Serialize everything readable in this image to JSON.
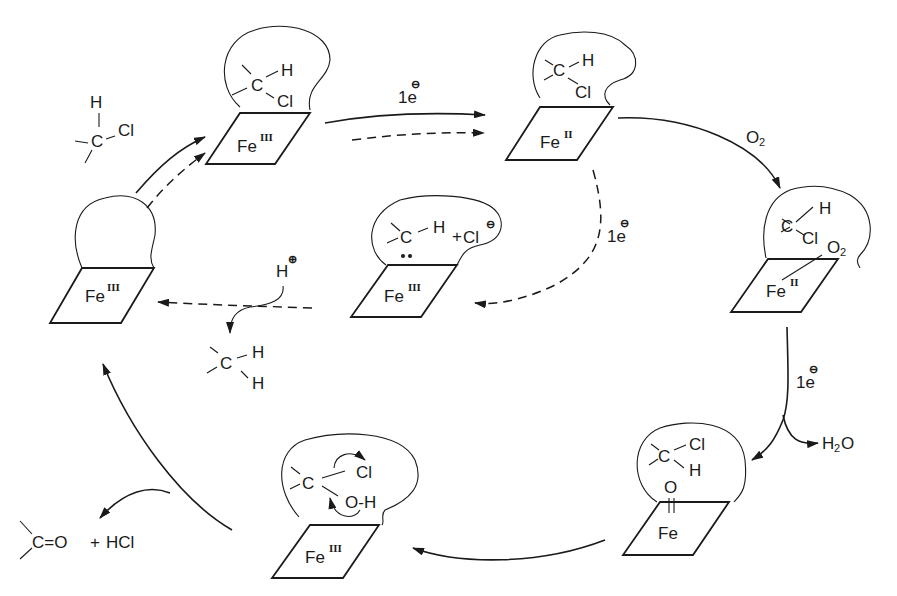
{
  "diagram": {
    "type": "catalytic-cycle",
    "iron_label": "Fe",
    "states": [
      {
        "id": "resting",
        "iron": "Fe",
        "oxidation": "III",
        "substrate": ""
      },
      {
        "id": "substrate-bound",
        "iron": "Fe",
        "oxidation": "III",
        "substrate": {
          "c": "C",
          "h": "H",
          "cl": "Cl"
        }
      },
      {
        "id": "reduced",
        "iron": "Fe",
        "oxidation": "II",
        "substrate": {
          "c": "C",
          "h": "H",
          "cl": "Cl"
        }
      },
      {
        "id": "oxy",
        "iron": "Fe",
        "oxidation": "II",
        "substrate": {
          "c": "C",
          "h": "H",
          "cl": "Cl",
          "o2": "O",
          "o2_sub": "2"
        }
      },
      {
        "id": "oxo",
        "iron": "Fe",
        "oxidation": "",
        "substrate": {
          "c": "C",
          "h": "H",
          "cl": "Cl",
          "o": "O"
        }
      },
      {
        "id": "hydroxylated",
        "iron": "Fe",
        "oxidation": "III",
        "substrate": {
          "c": "C",
          "cl": "Cl",
          "oh": "O-H"
        }
      },
      {
        "id": "carbene",
        "iron": "Fe",
        "oxidation": "III",
        "substrate": {
          "c": "C",
          "h": "H",
          "plus": "+",
          "cl": "Cl",
          "charge": "⊖"
        }
      }
    ],
    "free_substrate": {
      "h": "H",
      "c": "C",
      "cl": "Cl"
    },
    "arrows": {
      "e1": {
        "num": "1e",
        "charge": "⊖"
      },
      "o2": {
        "label": "O",
        "sub": "2"
      },
      "e2": {
        "num": "1e",
        "charge": "⊖"
      },
      "water": {
        "label": "H",
        "sub": "2",
        "tail": "O"
      },
      "e3": {
        "num": "1e",
        "charge": "⊖"
      },
      "proton": {
        "label": "H",
        "charge": "⊕"
      },
      "methylene": {
        "c": "C",
        "h1": "H",
        "h2": "H"
      }
    },
    "products": {
      "carbonyl": "C=O",
      "plus": "+",
      "acid": "HCl"
    }
  }
}
